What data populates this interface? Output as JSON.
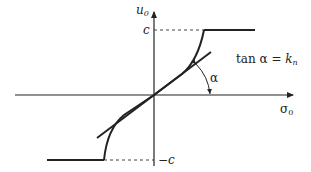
{
  "diagram": {
    "y_axis_label": "u",
    "y_axis_sub": "0",
    "x_axis_label": "σ",
    "x_axis_sub": "0",
    "top_level_label": "c",
    "bottom_level_label": "−c",
    "angle_label": "α",
    "equation_prefix": "tan α = ",
    "equation_var": "k",
    "equation_sub": "n",
    "colors": {
      "line": "#222222",
      "dashed": "#444444"
    }
  }
}
